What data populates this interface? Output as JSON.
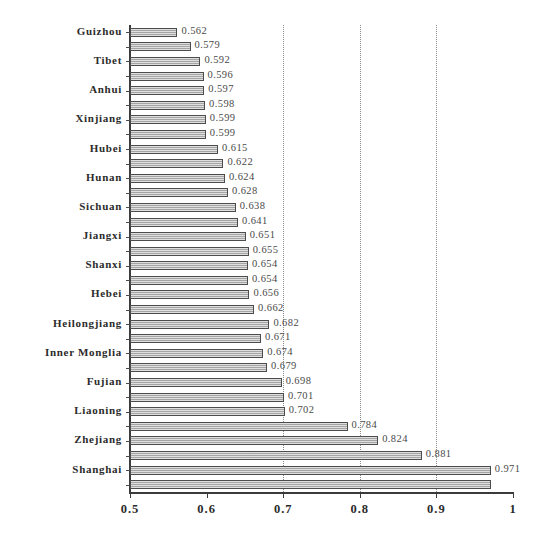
{
  "chart_data": {
    "type": "bar",
    "orientation": "horizontal",
    "title": "",
    "xlabel": "",
    "ylabel": "",
    "xlim": [
      0.5,
      1.0
    ],
    "xticks": [
      "0.5",
      "0.6",
      "0.7",
      "0.8",
      "0.9",
      "1"
    ],
    "xtick_values": [
      0.5,
      0.6,
      0.7,
      0.8,
      0.9,
      1.0
    ],
    "grid": "vertical dotted gridlines at 0.7, 0.8, 0.9",
    "legend": "none",
    "categories": [
      "Guizhou",
      "",
      "Tibet",
      "",
      "Anhui",
      "",
      "Xinjiang",
      "",
      "Hubei",
      "",
      "Hunan",
      "",
      "Sichuan",
      "",
      "Jiangxi",
      "",
      "Shanxi",
      "",
      "Hebei",
      "",
      "Heilongjiang",
      "",
      "Inner Monglia",
      "",
      "Fujian",
      "",
      "Liaoning",
      "",
      "Zhejiang",
      "",
      "Shanghai",
      ""
    ],
    "values": [
      0.562,
      0.579,
      0.592,
      0.596,
      0.597,
      0.598,
      0.599,
      0.599,
      0.615,
      0.622,
      0.624,
      0.628,
      0.638,
      0.641,
      0.651,
      0.655,
      0.654,
      0.654,
      0.656,
      0.662,
      0.682,
      0.671,
      0.674,
      0.679,
      0.698,
      0.701,
      0.702,
      0.784,
      0.824,
      0.881,
      0.971,
      0.971
    ],
    "value_labels": [
      "0.562",
      "0.579",
      "0.592",
      "0.596",
      "0.597",
      "0.598",
      "0.599",
      "0.599",
      "0.615",
      "0.622",
      "0.624",
      "0.628",
      "0.638",
      "0.641",
      "0.651",
      "0.655",
      "0.654",
      "0.654",
      "0.656",
      "0.662",
      "0.682",
      "0.671",
      "0.674",
      "0.679",
      "0.698",
      "0.701",
      "0.702",
      "0.784",
      "0.824",
      "0.881",
      "0.971",
      ""
    ],
    "visible_category_labels": [
      "Guizhou",
      "Tibet",
      "Anhui",
      "Xinjiang",
      "Hubei",
      "Hunan",
      "Sichuan",
      "Jiangxi",
      "Shanxi",
      "Hebei",
      "Heilongjiang",
      "Inner Monglia",
      "Fujian",
      "Liaoning",
      "Zhejiang",
      "Shanghai"
    ],
    "bar_style": {
      "fill": "#b8b8b8",
      "edge": "#4c4c4c",
      "hatch": "horizontal-line"
    }
  }
}
